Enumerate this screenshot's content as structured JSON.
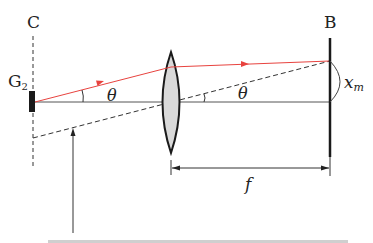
{
  "diagram": {
    "labels": {
      "C": "C",
      "G": "G",
      "G_sub": "2",
      "B": "B",
      "theta_left": "θ",
      "theta_right": "θ",
      "xm": "x",
      "xm_sub": "m",
      "f": "f"
    },
    "colors": {
      "ray": "#e8433f",
      "line": "#222222",
      "axis": "#555555",
      "lens_fill": "#d9d9d9"
    },
    "elements": [
      "dashed-plane-C",
      "grating-G2",
      "optical-axis",
      "convex-lens",
      "mirror-B",
      "incident-ray",
      "dashed-chief-ray",
      "focal-length-dimension",
      "pointer-arrow"
    ]
  }
}
